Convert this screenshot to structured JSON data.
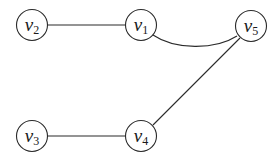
{
  "diagram": {
    "type": "graph",
    "directed": false,
    "nodes": [
      {
        "id": "v1",
        "label": "v",
        "subscript": "1",
        "x": 141,
        "y": 25
      },
      {
        "id": "v2",
        "label": "v",
        "subscript": "2",
        "x": 32,
        "y": 25
      },
      {
        "id": "v3",
        "label": "v",
        "subscript": "3",
        "x": 32,
        "y": 136
      },
      {
        "id": "v4",
        "label": "v",
        "subscript": "4",
        "x": 141,
        "y": 136
      },
      {
        "id": "v5",
        "label": "v",
        "subscript": "5",
        "x": 251,
        "y": 26
      }
    ],
    "edges": [
      {
        "from": "v2",
        "to": "v1",
        "shape": "straight"
      },
      {
        "from": "v1",
        "to": "v5",
        "shape": "curved"
      },
      {
        "from": "v3",
        "to": "v4",
        "shape": "straight"
      },
      {
        "from": "v4",
        "to": "v5",
        "shape": "straight"
      }
    ],
    "colors": {
      "stroke": "#2a2a2a",
      "background": "#ffffff",
      "text": "#1a1a1a"
    }
  }
}
